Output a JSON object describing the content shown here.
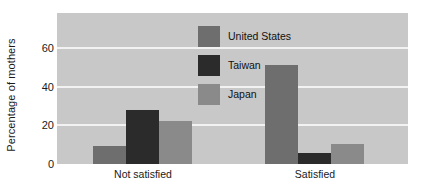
{
  "chart_data": {
    "type": "bar",
    "title": "",
    "subtitle": "",
    "xlabel": "",
    "ylabel": "Percentage of mothers",
    "categories": [
      "Not satisfied",
      "Satisfied"
    ],
    "series": [
      {
        "name": "United States",
        "color": "#6e6e6e",
        "values": [
          9.5,
          51
        ]
      },
      {
        "name": "Taiwan",
        "color": "#2b2b2b",
        "values": [
          28,
          5.5
        ]
      },
      {
        "name": "Japan",
        "color": "#8a8a8a",
        "values": [
          22,
          10.5
        ]
      }
    ],
    "ylim": [
      0,
      78
    ],
    "yticks": [
      0,
      20,
      40,
      60
    ],
    "ytick_labels": [
      "0",
      "20",
      "40",
      "60"
    ],
    "grid": true,
    "grid_axis": "y",
    "grid_color": "#f2f2f2",
    "legend_position": "inside-top-center",
    "plot_background": "#c8c8c8",
    "figure_background": "#ffffff",
    "annotations": []
  },
  "axes": {
    "y_title": "Percentage of mothers",
    "y_ticks": [
      {
        "label": "60",
        "value": 60
      },
      {
        "label": "40",
        "value": 40
      },
      {
        "label": "20",
        "value": 20
      },
      {
        "label": "0",
        "value": 0
      }
    ],
    "x_ticks": [
      {
        "label": "Not satisfied"
      },
      {
        "label": "Satisfied"
      }
    ]
  },
  "legend": {
    "entries": [
      {
        "label": "United States",
        "color": "#6e6e6e"
      },
      {
        "label": "Taiwan",
        "color": "#2b2b2b"
      },
      {
        "label": "Japan",
        "color": "#8a8a8a"
      }
    ]
  }
}
